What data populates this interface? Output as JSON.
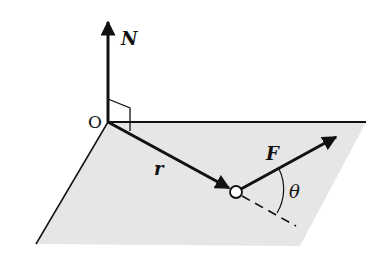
{
  "diagram": {
    "type": "vector-torque-plane",
    "labels": {
      "normal": "N",
      "origin": "O",
      "position": "r",
      "force": "F",
      "angle": "θ"
    },
    "colors": {
      "plane_fill": "#e6e6e6",
      "stroke": "#111111",
      "background": "#ffffff"
    }
  }
}
